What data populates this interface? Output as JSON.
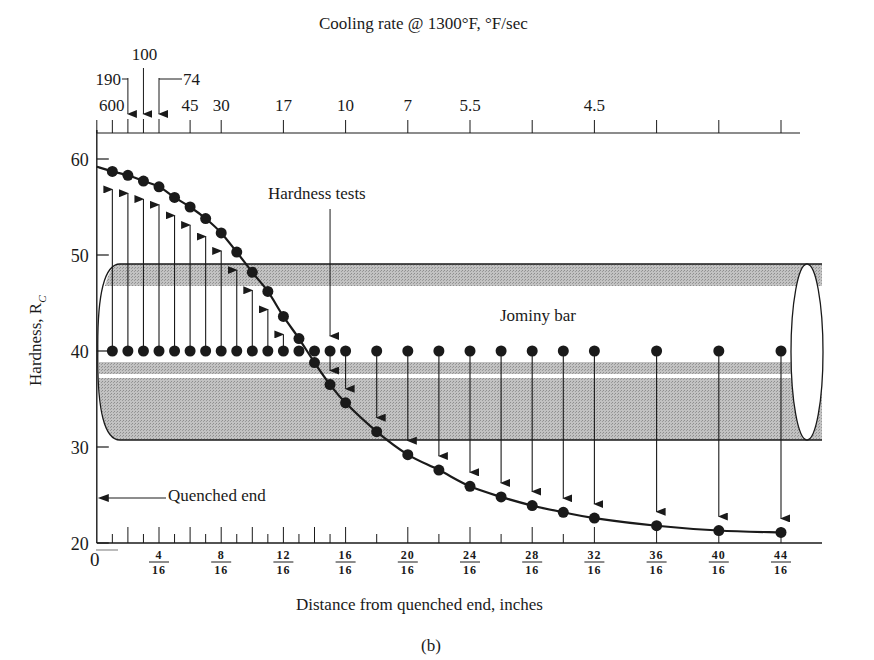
{
  "chart_data": {
    "type": "line",
    "title": "Cooling rate @ 1300°F, °F/sec",
    "xlabel": "Distance from quenched end, inches",
    "ylabel": "Hardness, R_C",
    "ylabel_display": "Hardness, Rc",
    "caption": "(b)",
    "ylim": [
      20,
      60
    ],
    "xlim": [
      0,
      46
    ],
    "x_unit": "1/16 inch",
    "grid": false,
    "legend": null,
    "y_ticks": [
      {
        "value": 20,
        "label": "20"
      },
      {
        "value": 30,
        "label": "30"
      },
      {
        "value": 40,
        "label": "40"
      },
      {
        "value": 50,
        "label": "50"
      },
      {
        "value": 60,
        "label": "60"
      }
    ],
    "x_ticks": [
      {
        "value": 0,
        "label": "0"
      },
      {
        "value": 4,
        "label": "4/16",
        "num": "4",
        "den": "16"
      },
      {
        "value": 8,
        "label": "8/16",
        "num": "8",
        "den": "16"
      },
      {
        "value": 12,
        "label": "12/16",
        "num": "12",
        "den": "16"
      },
      {
        "value": 16,
        "label": "16/16",
        "num": "16",
        "den": "16"
      },
      {
        "value": 20,
        "label": "20/16",
        "num": "20",
        "den": "16"
      },
      {
        "value": 24,
        "label": "24/16",
        "num": "24",
        "den": "16"
      },
      {
        "value": 28,
        "label": "28/16",
        "num": "28",
        "den": "16"
      },
      {
        "value": 32,
        "label": "32/16",
        "num": "32",
        "den": "16"
      },
      {
        "value": 36,
        "label": "36/16",
        "num": "36",
        "den": "16"
      },
      {
        "value": 40,
        "label": "40/16",
        "num": "40",
        "den": "16"
      },
      {
        "value": 44,
        "label": "44/16",
        "num": "44",
        "den": "16"
      }
    ],
    "top_axis": {
      "label": "Cooling rate @ 1300°F, °F/sec",
      "ticks": [
        {
          "x": 0,
          "label": "600"
        },
        {
          "x": 1,
          "label": ""
        },
        {
          "x": 2,
          "label": "190",
          "arrow": true
        },
        {
          "x": 3,
          "label": "100",
          "arrow": true
        },
        {
          "x": 4,
          "label": "74",
          "arrow": true
        },
        {
          "x": 6,
          "label": "45"
        },
        {
          "x": 8,
          "label": "30"
        },
        {
          "x": 12,
          "label": "17"
        },
        {
          "x": 16,
          "label": "10"
        },
        {
          "x": 20,
          "label": "7"
        },
        {
          "x": 24,
          "label": "5.5"
        },
        {
          "x": 28,
          "label": ""
        },
        {
          "x": 32,
          "label": "4.5"
        },
        {
          "x": 36,
          "label": ""
        },
        {
          "x": 40,
          "label": ""
        },
        {
          "x": 44,
          "label": ""
        }
      ]
    },
    "series": [
      {
        "name": "Jominy hardness curve",
        "x": [
          1,
          2,
          3,
          4,
          5,
          6,
          7,
          8,
          9,
          10,
          11,
          12,
          13,
          14,
          15,
          16,
          18,
          20,
          22,
          24,
          26,
          28,
          30,
          32,
          36,
          40,
          44
        ],
        "values": [
          58.7,
          58.3,
          57.7,
          57.1,
          56.0,
          55.0,
          53.8,
          52.3,
          50.3,
          48.2,
          46.2,
          43.6,
          41.3,
          38.8,
          36.5,
          34.6,
          31.6,
          29.2,
          27.6,
          25.9,
          24.8,
          23.9,
          23.2,
          22.6,
          21.8,
          21.3,
          21.1
        ]
      }
    ],
    "curve_start": {
      "x": 0,
      "y": 59.2
    },
    "test_points_level": 40,
    "annotations": [
      {
        "text": "Hardness tests",
        "points_to_x": 15
      },
      {
        "text": "Jominy bar"
      },
      {
        "text": "Quenched end",
        "arrow": "left"
      }
    ]
  },
  "labels": {
    "top_title": "Cooling rate @ 1300°F, °F/sec",
    "xlabel": "Distance from quenched end, inches",
    "ylabel": "Hardness, R",
    "ylabel_sub": "C",
    "caption": "(b)",
    "hardness_tests": "Hardness tests",
    "jominy_bar": "Jominy bar",
    "quenched_end": "Quenched end"
  },
  "colors": {
    "ink": "#1a1a1a",
    "bar_fill": "#b4b4b4",
    "background": "#ffffff"
  }
}
